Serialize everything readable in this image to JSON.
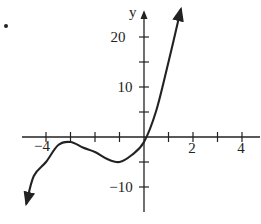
{
  "chart_data": {
    "type": "line",
    "title": "",
    "xlabel": "",
    "ylabel": "y",
    "xlim": [
      -5.5,
      4.8
    ],
    "ylim": [
      -15,
      25
    ],
    "x_ticks": [
      -4,
      -3,
      -2,
      -1,
      0,
      1,
      2,
      3,
      4
    ],
    "x_tick_labels": [
      "-4",
      "2",
      "4"
    ],
    "y_ticks": [
      -10,
      -5,
      0,
      5,
      10,
      15,
      20
    ],
    "y_tick_labels": [
      "20",
      "10",
      "-10"
    ],
    "grid": false,
    "legend": null,
    "series": [
      {
        "name": "f(x)",
        "description": "cubic with local max near (-3, -1) and local min near (-1, -5), arrows at both ends",
        "x": [
          -4.8,
          -4.5,
          -4.0,
          -3.5,
          -3.0,
          -2.5,
          -2.0,
          -1.5,
          -1.0,
          -0.5,
          0.0,
          0.5,
          1.0,
          1.5
        ],
        "y": [
          -13.3,
          -7.8,
          -5.0,
          -1.6,
          -1.0,
          -2.1,
          -3.0,
          -4.4,
          -5.0,
          -3.6,
          -1.0,
          5.3,
          15.0,
          25.5
        ]
      }
    ]
  },
  "labels": {
    "y_axis": "y",
    "x_neg4": "−4",
    "x_2": "2",
    "x_4": "4",
    "y_20": "20",
    "y_10": "10",
    "y_neg10": "−10"
  },
  "colors": {
    "ink": "#222222",
    "background": "#ffffff"
  }
}
